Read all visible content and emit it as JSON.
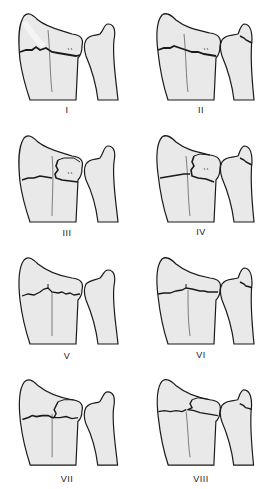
{
  "figure": {
    "type": "Distal radius fracture classification (Frykman types)",
    "panels": [
      {
        "label": "I",
        "fracture": "transverse-radius",
        "intraArticularRC": false,
        "intraArticularRU": false,
        "ulnarStyloid": false
      },
      {
        "label": "II",
        "fracture": "transverse-radius",
        "intraArticularRC": false,
        "intraArticularRU": false,
        "ulnarStyloid": true
      },
      {
        "label": "III",
        "fracture": "radiocarpal",
        "intraArticularRC": true,
        "intraArticularRU": false,
        "ulnarStyloid": false
      },
      {
        "label": "IV",
        "fracture": "radiocarpal",
        "intraArticularRC": true,
        "intraArticularRU": false,
        "ulnarStyloid": true
      },
      {
        "label": "V",
        "fracture": "radioulnar",
        "intraArticularRC": false,
        "intraArticularRU": true,
        "ulnarStyloid": false
      },
      {
        "label": "VI",
        "fracture": "radioulnar",
        "intraArticularRC": false,
        "intraArticularRU": true,
        "ulnarStyloid": true
      },
      {
        "label": "VII",
        "fracture": "both-joints",
        "intraArticularRC": true,
        "intraArticularRU": true,
        "ulnarStyloid": false
      },
      {
        "label": "VIII",
        "fracture": "both-joints",
        "intraArticularRC": true,
        "intraArticularRU": true,
        "ulnarStyloid": true
      }
    ],
    "colors": {
      "background": "#ffffff",
      "bone_fill": "#e9e9e9",
      "bone_highlight": "#f6f6f6",
      "outline": "#1a1a1a",
      "label_text": "#222222"
    }
  }
}
